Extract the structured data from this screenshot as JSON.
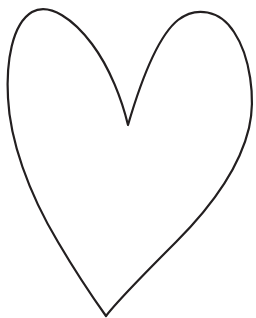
{
  "canvas": {
    "width": 256,
    "height": 318,
    "background_color": "#ffffff",
    "title": "Heart Outline Drawing",
    "alt_text": "Hand-drawn outline of a heart shape"
  },
  "artwork": {
    "name": "heart-outline",
    "type": "line-art",
    "description": "Single closed outline of a heart, drawn freehand, asymmetric lobes",
    "stroke_color": "#231f20",
    "fill_color": "none",
    "stroke_width": 2.2,
    "path": "M 128 125 C 122 100 110 68 92 44 C 74 20 50 2 32 12 C 12 24 6 62 8 98 C 10 140 28 192 58 242 C 78 276 96 302 106 316 C 118 300 146 272 176 242 C 214 204 240 166 249 128 C 256 98 250 56 234 32 C 220 10 196 6 178 20 C 158 36 140 84 128 125 Z",
    "key_points": {
      "left_lobe_peak": [
        52,
        5
      ],
      "right_lobe_peak": [
        215,
        22
      ],
      "cleft_bottom": [
        128,
        125
      ],
      "leftmost": [
        7,
        102
      ],
      "rightmost": [
        251,
        126
      ],
      "bottom_tip": [
        106,
        316
      ]
    }
  }
}
